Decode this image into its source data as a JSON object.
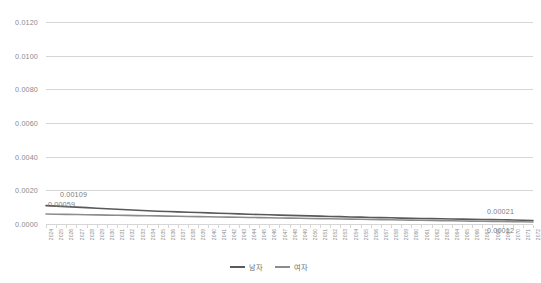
{
  "chart_data": {
    "type": "line",
    "title": "",
    "xlabel": "",
    "ylabel": "",
    "ylim": [
      0.0,
      0.012
    ],
    "y_ticks": [
      "0.0000",
      "0.0020",
      "0.0040",
      "0.0060",
      "0.0080",
      "0.0100",
      "0.0120"
    ],
    "y_tick_values": [
      0.0,
      0.002,
      0.004,
      0.006,
      0.008,
      0.01,
      0.012
    ],
    "grid": "horizontal",
    "legend_position": "bottom-center",
    "categories": [
      "2024",
      "2025",
      "2026",
      "2027",
      "2028",
      "2029",
      "2030",
      "2031",
      "2032",
      "2033",
      "2034",
      "2035",
      "2036",
      "2037",
      "2038",
      "2039",
      "2040",
      "2041",
      "2042",
      "2043",
      "2044",
      "2045",
      "2046",
      "2047",
      "2048",
      "2049",
      "2050",
      "2051",
      "2052",
      "2053",
      "2054",
      "2055",
      "2056",
      "2057",
      "2058",
      "2059",
      "2060",
      "2061",
      "2062",
      "2063",
      "2064",
      "2065",
      "2066",
      "2067",
      "2068",
      "2069",
      "2070",
      "2071",
      "2072"
    ],
    "series": [
      {
        "name": "남자",
        "color": "#595959",
        "values": [
          0.00109,
          0.00106,
          0.00103,
          0.001,
          0.00097,
          0.00094,
          0.00091,
          0.00088,
          0.00085,
          0.00082,
          0.00079,
          0.00076,
          0.00074,
          0.00072,
          0.0007,
          0.00068,
          0.00066,
          0.00064,
          0.00062,
          0.0006,
          0.00058,
          0.00056,
          0.00055,
          0.00053,
          0.00051,
          0.0005,
          0.00048,
          0.00047,
          0.00045,
          0.00044,
          0.00042,
          0.00041,
          0.00039,
          0.00038,
          0.00037,
          0.00035,
          0.00034,
          0.00033,
          0.00032,
          0.00031,
          0.0003,
          0.00029,
          0.00028,
          0.00027,
          0.00026,
          0.00025,
          0.00024,
          0.00022,
          0.00021
        ]
      },
      {
        "name": "여자",
        "color": "#8c8c8c",
        "values": [
          0.00059,
          0.00058,
          0.00057,
          0.00056,
          0.00055,
          0.00054,
          0.00053,
          0.00052,
          0.00051,
          0.0005,
          0.00049,
          0.00048,
          0.00047,
          0.00046,
          0.00045,
          0.00044,
          0.00043,
          0.00042,
          0.00041,
          0.0004,
          0.00039,
          0.00038,
          0.00037,
          0.00036,
          0.00035,
          0.00034,
          0.00033,
          0.00032,
          0.00031,
          0.0003,
          0.00029,
          0.00028,
          0.00027,
          0.00026,
          0.00025,
          0.00024,
          0.00023,
          0.00022,
          0.00021,
          0.0002,
          0.00019,
          0.00018,
          0.00017,
          0.00016,
          0.00015,
          0.00015,
          0.00014,
          0.00013,
          0.00012
        ]
      }
    ],
    "annotations": [
      {
        "text": "0.00109",
        "series": "남자",
        "position": "start"
      },
      {
        "text": "0.00059",
        "series": "여자",
        "position": "start"
      },
      {
        "text": "0.00021",
        "series": "남자",
        "position": "end"
      },
      {
        "text": "0.00012",
        "series": "여자",
        "position": "end"
      }
    ]
  },
  "legend": {
    "items": [
      {
        "label": "남자",
        "color": "#595959"
      },
      {
        "label": "여자",
        "color": "#8c8c8c"
      }
    ]
  },
  "labels": {
    "male_start": "0.00109",
    "female_start": "0.00059",
    "male_end": "0.00021",
    "female_end": "0.00012"
  },
  "colors": {
    "background": "#ffffff",
    "gridline": "#d6d6d6",
    "axis_text": "#8a8a8a",
    "male_line": "#595959",
    "female_line": "#8c8c8c"
  }
}
